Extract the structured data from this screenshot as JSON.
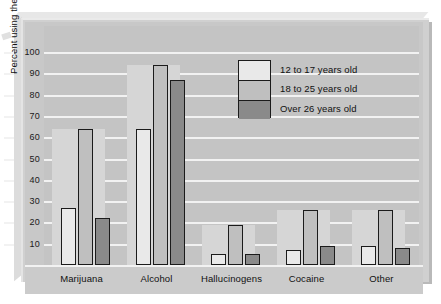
{
  "chart_data": {
    "type": "bar",
    "title": "",
    "xlabel": "",
    "ylabel": "Percent using the drug",
    "ylim": [
      0,
      100
    ],
    "yticks": [
      10,
      20,
      30,
      40,
      50,
      60,
      70,
      80,
      90,
      100
    ],
    "grid": true,
    "legend_position": "upper-center",
    "categories": [
      "Marijuana",
      "Alcohol",
      "Hallucinogens",
      "Cocaine",
      "Other"
    ],
    "series": [
      {
        "name": "12 to 17 years old",
        "color": "#e9e9e9",
        "values": [
          27,
          64,
          5,
          7,
          9
        ]
      },
      {
        "name": "18 to 25 years old",
        "color": "#bfbfbf",
        "values": [
          64,
          94,
          19,
          26,
          26
        ]
      },
      {
        "name": "Over 26 years old",
        "color": "#8a8a8a",
        "values": [
          22,
          87,
          5,
          9,
          8
        ]
      }
    ]
  },
  "legend": {
    "items": [
      {
        "label": "12 to 17 years old"
      },
      {
        "label": "18 to 25 years old"
      },
      {
        "label": "Over 26 years old"
      }
    ]
  }
}
